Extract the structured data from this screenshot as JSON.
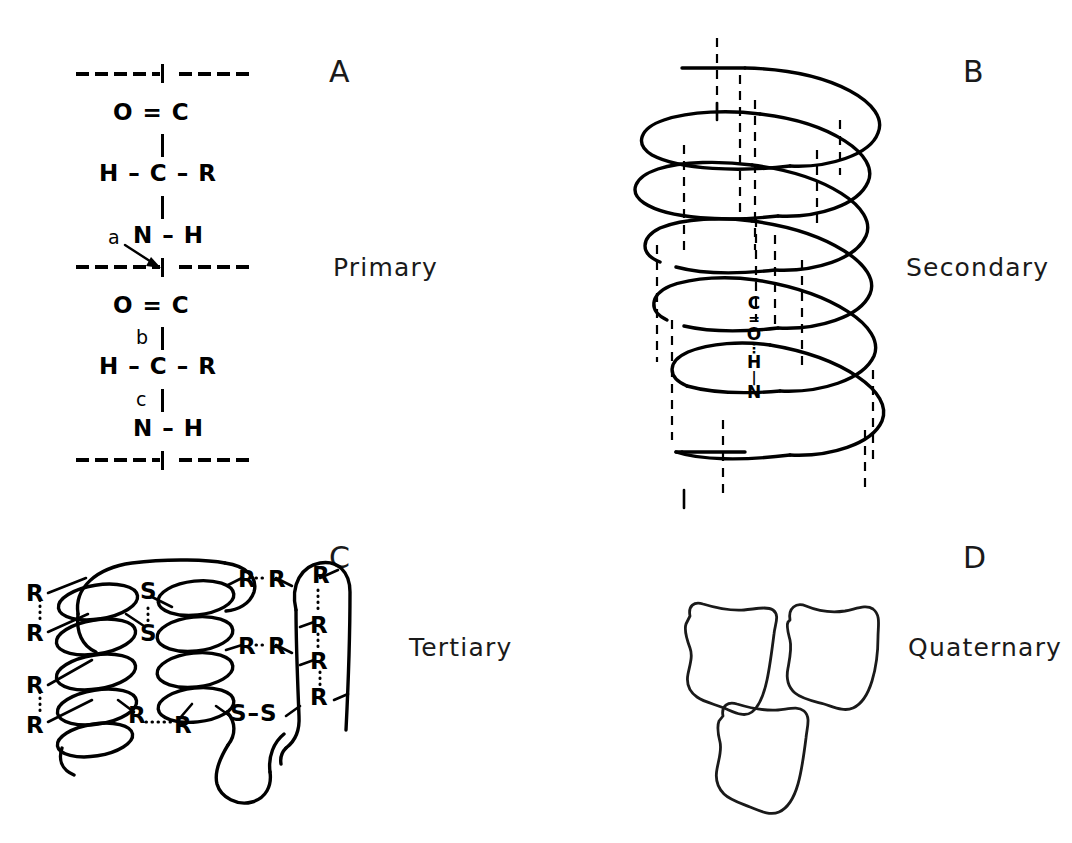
{
  "figure": {
    "background_color": "#ffffff",
    "ink_color": "#000000",
    "width": 1072,
    "height": 843
  },
  "panels": [
    {
      "letter": "A",
      "label": "Primary",
      "type": "peptide-backbone-chain",
      "bond_annotations": [
        "a",
        "b",
        "c"
      ],
      "repeat_unit_atoms": [
        "O",
        "C",
        "H",
        "C",
        "R",
        "N",
        "H"
      ]
    },
    {
      "letter": "B",
      "label": "Secondary",
      "type": "alpha-helix",
      "coil_count": 5,
      "hydrogen_bond_atoms": [
        "C",
        "O",
        "H",
        "N"
      ]
    },
    {
      "letter": "C",
      "label": "Tertiary",
      "type": "folded-chain-with-bonds",
      "side_chain_symbol": "R",
      "disulfide_symbol": "S",
      "disulfide_bridge_count": 2
    },
    {
      "letter": "D",
      "label": "Quaternary",
      "type": "subunit-assembly",
      "subunit_count": 3
    }
  ],
  "panel_a": {
    "letter": "A",
    "label": "Primary",
    "unit_one": {
      "carbonyl": "O = C",
      "alpha": "H – C – R",
      "amine": "N – H"
    },
    "unit_two": {
      "carbonyl": "O = C",
      "alpha": "H – C – R",
      "amine": "N – H"
    },
    "marker_a": "a",
    "marker_b": "b",
    "marker_c": "c"
  },
  "panel_b": {
    "letter": "B",
    "label": "Secondary",
    "hbond": {
      "c": "C",
      "o": "O",
      "h": "H",
      "n": "N",
      "double_bond": "=",
      "dotted_bond": "⋮"
    }
  },
  "panel_c": {
    "letter": "C",
    "label": "Tertiary",
    "left_side_chains": [
      "R",
      "R",
      "R",
      "R"
    ],
    "inner_pair": [
      "R",
      "R"
    ],
    "right_pairs": [
      [
        "R",
        "R"
      ],
      [
        "R",
        "R"
      ]
    ],
    "far_right_chains": [
      "R",
      "R",
      "R",
      "R"
    ],
    "disulfide_upper": [
      "S",
      "S"
    ],
    "disulfide_lower": [
      "S",
      "S"
    ],
    "disulfide_lower_text": "S–S"
  },
  "panel_d": {
    "letter": "D",
    "label": "Quaternary",
    "subunits": 3
  }
}
